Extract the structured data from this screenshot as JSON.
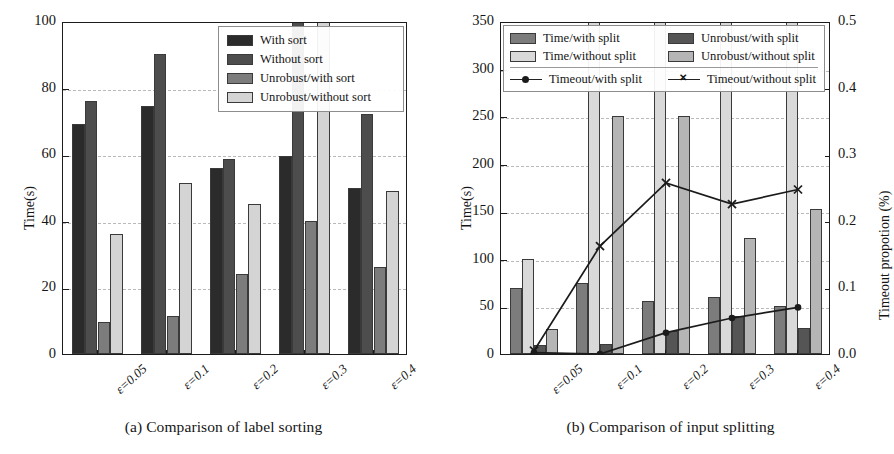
{
  "figure": {
    "panels": [
      {
        "caption": "(a) Comparison of label sorting"
      },
      {
        "caption": "(b) Comparison of input splitting"
      }
    ]
  },
  "chart_data": [
    {
      "type": "bar",
      "title": "",
      "panel_caption": "(a) Comparison of label sorting",
      "xlabel": "",
      "ylabel": "Time(s)",
      "ylim": [
        0,
        100
      ],
      "yticks": [
        0,
        20,
        40,
        60,
        80,
        100
      ],
      "grid": true,
      "legend_position": "top-right",
      "categories": [
        "ε=0.05",
        "ε=0.1",
        "ε=0.2",
        "ε=0.3",
        "ε=0.4"
      ],
      "series": [
        {
          "name": "With sort",
          "color": "#2b2b2b",
          "values": [
            69,
            74.5,
            56,
            59.5,
            50
          ]
        },
        {
          "name": "Without sort",
          "color": "#4d4d4d",
          "values": [
            76,
            90,
            58.5,
            100,
            72
          ]
        },
        {
          "name": "Unrobust/with sort",
          "color": "#7c7c7c",
          "values": [
            9.5,
            11.5,
            24,
            40,
            26
          ]
        },
        {
          "name": "Unrobust/without sort",
          "color": "#d4d4d4",
          "values": [
            36,
            51.5,
            45,
            100,
            49
          ]
        }
      ],
      "notes": "Bars for ε=0.3 (Without sort, Unrobust/without sort) are clipped at the top of the axis."
    },
    {
      "type": "bar",
      "title": "",
      "panel_caption": "(b) Comparison of input splitting",
      "xlabel": "",
      "ylabel": "Time(s)",
      "y2label": "Timeout propotion (%)",
      "ylim": [
        0,
        350
      ],
      "yticks": [
        0,
        50,
        100,
        150,
        200,
        250,
        300,
        350
      ],
      "y2lim": [
        0.0,
        0.5
      ],
      "y2ticks": [
        "0.0",
        "0.1",
        "0.2",
        "0.3",
        "0.4",
        "0.5"
      ],
      "grid": true,
      "legend_position": "top",
      "categories": [
        "ε=0.05",
        "ε=0.1",
        "ε=0.2",
        "ε=0.3",
        "ε=0.4"
      ],
      "series": [
        {
          "name": "Time/with split",
          "color": "#7c7c7c",
          "axis": "left",
          "values": [
            69,
            75,
            56,
            60,
            50
          ]
        },
        {
          "name": "Time/without split",
          "color": "#d9d9d9",
          "axis": "left",
          "values": [
            100,
            350,
            350,
            350,
            350
          ]
        },
        {
          "name": "Unrobust/with split",
          "color": "#555555",
          "axis": "left",
          "values": [
            9,
            11,
            24,
            40,
            27
          ]
        },
        {
          "name": "Unrobust/without split",
          "color": "#b5b5b5",
          "axis": "left",
          "values": [
            26,
            250,
            250,
            122,
            152
          ]
        }
      ],
      "line_series": [
        {
          "name": "Timeout/with split",
          "marker": "circle",
          "color": "#1b1b1b",
          "axis": "right",
          "values": [
            0.005,
            0.003,
            0.035,
            0.057,
            0.073
          ]
        },
        {
          "name": "Timeout/without split",
          "marker": "x",
          "color": "#1b1b1b",
          "axis": "right",
          "values": [
            0.008,
            0.165,
            0.26,
            0.228,
            0.25
          ]
        }
      ],
      "notes": "Time/without split bars are clipped at the top of the 350 s axis."
    }
  ]
}
